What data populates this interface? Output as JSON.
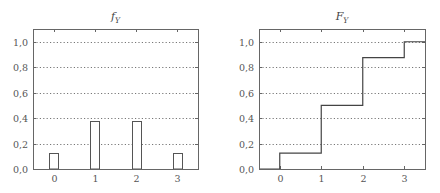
{
  "chart_data": [
    {
      "type": "bar",
      "title": "f_Y",
      "title_display": "f",
      "title_sub": "Y",
      "xlabel": "",
      "ylabel": "",
      "categories": [
        0,
        1,
        2,
        3
      ],
      "values": [
        0.125,
        0.375,
        0.375,
        0.125
      ],
      "x_ticks": [
        "0",
        "1",
        "2",
        "3"
      ],
      "y_ticks": [
        "0,0",
        "0,2",
        "0,4",
        "0,6",
        "0,8",
        "1,0"
      ],
      "xlim": [
        -0.5,
        3.5
      ],
      "ylim": [
        0,
        1.1
      ],
      "grid": "horizontal dotted",
      "legend": null
    },
    {
      "type": "line",
      "subtype": "step",
      "title": "F_Y",
      "title_display": "F",
      "title_sub": "Y",
      "xlabel": "",
      "ylabel": "",
      "x": [
        -0.5,
        0,
        1,
        2,
        3,
        3.5
      ],
      "y": [
        0,
        0.125,
        0.5,
        0.875,
        1.0,
        1.0
      ],
      "x_ticks": [
        "0",
        "1",
        "2",
        "3"
      ],
      "y_ticks": [
        "0,0",
        "0,2",
        "0,4",
        "0,6",
        "0,8",
        "1,0"
      ],
      "xlim": [
        -0.5,
        3.5
      ],
      "ylim": [
        0,
        1.1
      ],
      "grid": "horizontal dotted",
      "legend": null
    }
  ]
}
